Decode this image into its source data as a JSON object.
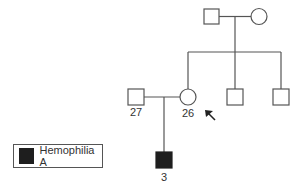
{
  "pedigree": {
    "generation1": [
      {
        "id": "grandfather",
        "sex": "male",
        "affected": false
      },
      {
        "id": "grandmother",
        "sex": "female",
        "affected": false
      }
    ],
    "generation2": [
      {
        "id": "husband",
        "sex": "male",
        "affected": false,
        "label": "27"
      },
      {
        "id": "proband-mother",
        "sex": "female",
        "affected": false,
        "label": "26",
        "arrow": true
      },
      {
        "id": "brother-1",
        "sex": "male",
        "affected": false
      },
      {
        "id": "brother-2",
        "sex": "male",
        "affected": false
      }
    ],
    "generation3": [
      {
        "id": "son",
        "sex": "male",
        "affected": true,
        "label": "3"
      }
    ]
  },
  "labels": {
    "husband": "27",
    "mother": "26",
    "son": "3"
  },
  "legend": {
    "label": "Hemophilia A",
    "symbol": "filled-square"
  },
  "colors": {
    "line": "#555555",
    "affected": "#1e1e1e"
  }
}
